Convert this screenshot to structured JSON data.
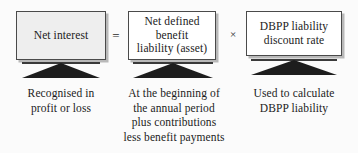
{
  "diagram": {
    "background_color": "#fbfbfb",
    "boxes": [
      {
        "id": "net-interest",
        "text": "Net interest",
        "fill": "#eeeeee",
        "border_color": "#4a4a4a"
      },
      {
        "id": "net-defined-benefit-liability",
        "text": "Net defined\nbenefit\nliability (asset)",
        "fill": "#ffffff",
        "border_color": "#4a4a4a"
      },
      {
        "id": "dbpp-liability-discount-rate",
        "text": "DBPP liability\ndiscount rate",
        "fill": "#ffffff",
        "border_color": "#4a4a4a"
      }
    ],
    "operators": [
      {
        "id": "equals",
        "symbol": "="
      },
      {
        "id": "times",
        "symbol": "×"
      }
    ],
    "connectors": [
      {
        "id": "arrow-1",
        "shape": "up-triangle",
        "color": "#1d1d1d"
      },
      {
        "id": "arrow-2",
        "shape": "up-triangle",
        "color": "#1d1d1d"
      },
      {
        "id": "arrow-3",
        "shape": "up-triangle",
        "color": "#1d1d1d"
      }
    ],
    "captions": [
      {
        "id": "caption-net-interest",
        "text": "Recognised in\nprofit or loss"
      },
      {
        "id": "caption-net-defined-benefit-liability",
        "text": "At the beginning of\nthe annual period\nplus contributions\nless benefit payments"
      },
      {
        "id": "caption-dbpp-liability-discount-rate",
        "text": "Used to calculate\nDBPP liability"
      }
    ]
  }
}
